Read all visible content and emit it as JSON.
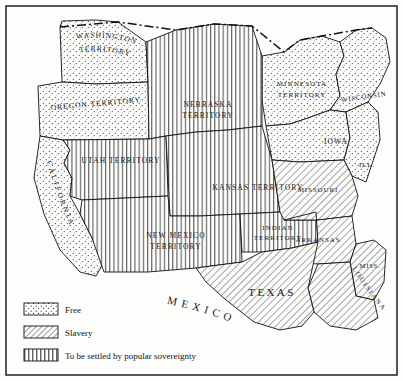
{
  "map": {
    "title_neighbor_north": "BRITISH POSSESSIONS",
    "title_neighbor_south": "MEXICO",
    "regions": [
      {
        "id": "washington-territory",
        "label": "WASHINGTON TERRITORY",
        "status": "free"
      },
      {
        "id": "oregon-territory",
        "label": "OREGON TERRITORY",
        "status": "free"
      },
      {
        "id": "california",
        "label": "CALIFORNIA",
        "status": "free"
      },
      {
        "id": "utah-territory",
        "label": "UTAH TERRITORY",
        "status": "popular-sovereignty"
      },
      {
        "id": "new-mexico-territory",
        "label": "NEW MEXICO TERRITORY",
        "status": "popular-sovereignty"
      },
      {
        "id": "nebraska-territory",
        "label": "NEBRASKA TERRITORY",
        "status": "popular-sovereignty"
      },
      {
        "id": "kansas-territory",
        "label": "KANSAS TERRITORY",
        "status": "popular-sovereignty"
      },
      {
        "id": "indian-territory",
        "label": "INDIAN TERRITORY",
        "status": "popular-sovereignty"
      },
      {
        "id": "minnesota-territory",
        "label": "MINNESOTA TERRITORY",
        "status": "free"
      },
      {
        "id": "wisconsin",
        "label": "WISCONSIN",
        "status": "free"
      },
      {
        "id": "iowa",
        "label": "IOWA",
        "status": "free"
      },
      {
        "id": "illinois",
        "label": "ILL.",
        "status": "free"
      },
      {
        "id": "missouri",
        "label": "MISSOURI",
        "status": "slavery"
      },
      {
        "id": "arkansas",
        "label": "ARKANSAS",
        "status": "slavery"
      },
      {
        "id": "mississippi",
        "label": "MISS.",
        "status": "slavery"
      },
      {
        "id": "louisiana",
        "label": "LOUISIANA",
        "status": "slavery"
      },
      {
        "id": "texas",
        "label": "TEXAS",
        "status": "slavery"
      }
    ],
    "labels": {
      "washington_territory_l1": "WASHINGTON",
      "washington_territory_l2": "TERRITORY",
      "oregon_territory": "OREGON TERRITORY",
      "california": "CALIFORNIA",
      "utah_territory": "UTAH TERRITORY",
      "new_mexico_l1": "NEW MEXICO",
      "new_mexico_l2": "TERRITORY",
      "nebraska_l1": "NEBRASKA",
      "nebraska_l2": "TERRITORY",
      "kansas_territory": "KANSAS TERRITORY",
      "indian_l1": "INDIAN",
      "indian_l2": "TERRITORY",
      "minnesota_l1": "MINNESOTA",
      "minnesota_l2": "TERRITORY",
      "wisconsin": "WISCONSIN",
      "iowa": "IOWA",
      "illinois": "ILL.",
      "missouri": "MISSOURI",
      "arkansas": "ARKANSAS",
      "mississippi": "MISS.",
      "louisiana": "LOUISIANA",
      "texas": "TEXAS"
    }
  },
  "legend": {
    "items": [
      {
        "key": "free",
        "swatch": "stipple-swatch",
        "label": "Free"
      },
      {
        "key": "slavery",
        "swatch": "diagonal-hatch-swatch",
        "label": "Slavery"
      },
      {
        "key": "popular-sovereignty",
        "swatch": "vertical-line-swatch",
        "label": "To be settled by popular sovereignty"
      }
    ]
  },
  "colors": {
    "ink": "#1a1a1a",
    "paper": "#fdfdfc",
    "hatch": "#555555",
    "stipple": "#444444"
  }
}
